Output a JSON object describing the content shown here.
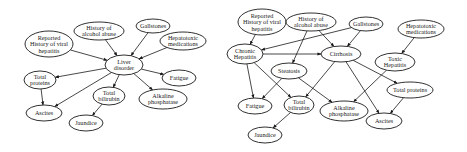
{
  "diagrams": [
    {
      "id": "left",
      "title": "",
      "nodes": [
        {
          "id": "viral",
          "lines": [
            "Reported",
            "History of viral",
            "hepatitis"
          ],
          "cx": 49,
          "cy": 44,
          "rx": 24,
          "ry": 13
        },
        {
          "id": "alcohol",
          "lines": [
            "History of",
            "alcohol abuse"
          ],
          "cx": 99,
          "cy": 31,
          "rx": 25,
          "ry": 9
        },
        {
          "id": "gall",
          "lines": [
            "Gallstones"
          ],
          "cx": 153,
          "cy": 26,
          "rx": 17,
          "ry": 7
        },
        {
          "id": "hepatox",
          "lines": [
            "Hepatotoxic",
            "medications"
          ],
          "cx": 183,
          "cy": 41,
          "rx": 23,
          "ry": 9
        },
        {
          "id": "liver",
          "lines": [
            "Liver",
            "disorder"
          ],
          "cx": 124,
          "cy": 65,
          "rx": 19,
          "ry": 10
        },
        {
          "id": "tprot",
          "lines": [
            "Total",
            "proteins"
          ],
          "cx": 40,
          "cy": 80,
          "rx": 16,
          "ry": 9
        },
        {
          "id": "fatigue",
          "lines": [
            "Fatigue"
          ],
          "cx": 179,
          "cy": 78,
          "rx": 17,
          "ry": 8
        },
        {
          "id": "tbili",
          "lines": [
            "Total",
            "bilirubin"
          ],
          "cx": 109,
          "cy": 96,
          "rx": 16,
          "ry": 9
        },
        {
          "id": "alk",
          "lines": [
            "Alkaline",
            "phosphatase"
          ],
          "cx": 163,
          "cy": 99,
          "rx": 24,
          "ry": 10
        },
        {
          "id": "ascites",
          "lines": [
            "Ascites"
          ],
          "cx": 44,
          "cy": 113,
          "rx": 18,
          "ry": 8
        },
        {
          "id": "jaundice",
          "lines": [
            "Jaundice"
          ],
          "cx": 86,
          "cy": 123,
          "rx": 17,
          "ry": 8
        }
      ],
      "edges": [
        [
          "viral",
          "liver"
        ],
        [
          "alcohol",
          "liver"
        ],
        [
          "gall",
          "liver"
        ],
        [
          "hepatox",
          "liver"
        ],
        [
          "liver",
          "tprot"
        ],
        [
          "liver",
          "fatigue"
        ],
        [
          "liver",
          "tbili"
        ],
        [
          "liver",
          "alk"
        ],
        [
          "liver",
          "ascites"
        ],
        [
          "tprot",
          "ascites"
        ],
        [
          "tbili",
          "jaundice"
        ]
      ]
    },
    {
      "id": "right",
      "title": "",
      "nodes": [
        {
          "id": "viral",
          "lines": [
            "Reported",
            "History of viral",
            "hepatitis"
          ],
          "cx": 262,
          "cy": 22,
          "rx": 24,
          "ry": 13
        },
        {
          "id": "alcohol",
          "lines": [
            "History of",
            "alcohol abuse"
          ],
          "cx": 311,
          "cy": 22,
          "rx": 25,
          "ry": 9
        },
        {
          "id": "gall",
          "lines": [
            "Gallstones"
          ],
          "cx": 366,
          "cy": 24,
          "rx": 17,
          "ry": 7
        },
        {
          "id": "hepatox",
          "lines": [
            "Hepatotoxic",
            "medications"
          ],
          "cx": 421,
          "cy": 29,
          "rx": 23,
          "ry": 9
        },
        {
          "id": "chronic",
          "lines": [
            "Chronic",
            "Hepatitis"
          ],
          "cx": 245,
          "cy": 54,
          "rx": 18,
          "ry": 10
        },
        {
          "id": "cirr",
          "lines": [
            "Cirrhosis"
          ],
          "cx": 341,
          "cy": 54,
          "rx": 20,
          "ry": 8
        },
        {
          "id": "toxic",
          "lines": [
            "Toxic",
            "Hepatitis"
          ],
          "cx": 395,
          "cy": 62,
          "rx": 20,
          "ry": 9
        },
        {
          "id": "steat",
          "lines": [
            "Steatosis"
          ],
          "cx": 289,
          "cy": 71,
          "rx": 18,
          "ry": 8
        },
        {
          "id": "tprot",
          "lines": [
            "Total proteins"
          ],
          "cx": 410,
          "cy": 90,
          "rx": 23,
          "ry": 8
        },
        {
          "id": "fatigue",
          "lines": [
            "Fatigue"
          ],
          "cx": 255,
          "cy": 106,
          "rx": 17,
          "ry": 8
        },
        {
          "id": "tbili",
          "lines": [
            "Total",
            "bilirubin"
          ],
          "cx": 299,
          "cy": 105,
          "rx": 15,
          "ry": 9
        },
        {
          "id": "alk",
          "lines": [
            "Alkaline",
            "phosphatase"
          ],
          "cx": 344,
          "cy": 111,
          "rx": 24,
          "ry": 10
        },
        {
          "id": "ascites",
          "lines": [
            "Ascites"
          ],
          "cx": 384,
          "cy": 121,
          "rx": 18,
          "ry": 8
        },
        {
          "id": "jaundice",
          "lines": [
            "Jaundice"
          ],
          "cx": 265,
          "cy": 135,
          "rx": 17,
          "ry": 8
        }
      ],
      "edges": [
        [
          "viral",
          "chronic"
        ],
        [
          "gall",
          "chronic"
        ],
        [
          "chronic",
          "cirr"
        ],
        [
          "alcohol",
          "cirr"
        ],
        [
          "alcohol",
          "steat"
        ],
        [
          "gall",
          "cirr"
        ],
        [
          "hepatox",
          "toxic"
        ],
        [
          "chronic",
          "fatigue"
        ],
        [
          "chronic",
          "tbili"
        ],
        [
          "steat",
          "fatigue"
        ],
        [
          "steat",
          "alk"
        ],
        [
          "cirr",
          "tbili"
        ],
        [
          "cirr",
          "tprot"
        ],
        [
          "cirr",
          "ascites"
        ],
        [
          "toxic",
          "alk"
        ],
        [
          "tprot",
          "ascites"
        ],
        [
          "tbili",
          "jaundice"
        ]
      ]
    }
  ]
}
